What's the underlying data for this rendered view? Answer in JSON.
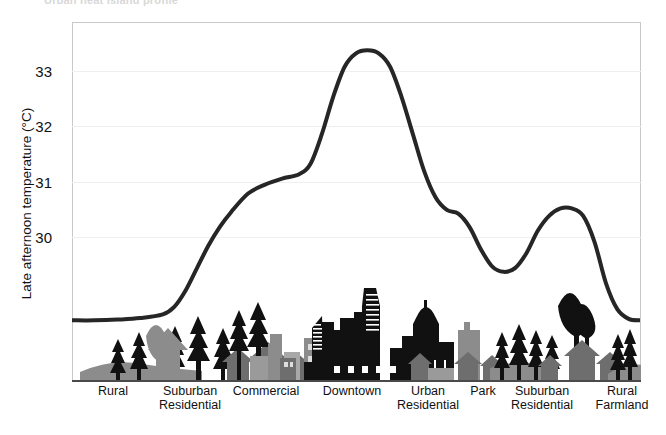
{
  "title": "Urban heat island profile",
  "axes": {
    "ylabel": "Late afternoon temperature (°C)",
    "yticks": [
      "33",
      "32",
      "31",
      "30"
    ],
    "ytick_values": [
      33,
      32,
      31,
      30
    ],
    "xlabels": [
      {
        "line1": "Rural",
        "line2": ""
      },
      {
        "line1": "Suburban",
        "line2": "Residential"
      },
      {
        "line1": "Commercial",
        "line2": ""
      },
      {
        "line1": "Downtown",
        "line2": ""
      },
      {
        "line1": "Urban",
        "line2": "Residential"
      },
      {
        "line1": "Park",
        "line2": ""
      },
      {
        "line1": "Suburban",
        "line2": "Residential"
      },
      {
        "line1": "Rural",
        "line2": "Farmland"
      }
    ]
  },
  "colors": {
    "line": "#262626",
    "grid": "#efefef",
    "frame": "#c9c9c9",
    "axis": "#4a4a4a",
    "silhouette_dark": "#111111",
    "silhouette_mid": "#8c8c8c",
    "silhouette_light": "#b5b5b5"
  },
  "chart_data": {
    "type": "line",
    "title": "Urban heat island profile",
    "xlabel": "",
    "ylabel": "Late afternoon temperature (°C)",
    "ylim": [
      28.8,
      33.6
    ],
    "xlim": [
      0,
      100
    ],
    "grid": true,
    "legend": "none",
    "categories": [
      "Rural",
      "Suburban Residential",
      "Commercial",
      "Downtown",
      "Urban Residential",
      "Park",
      "Suburban Residential",
      "Rural Farmland"
    ],
    "category_x": [
      7,
      21,
      34,
      49,
      63,
      72,
      83,
      97
    ],
    "category_values": [
      29.6,
      30.6,
      31.5,
      33.2,
      31.05,
      30.25,
      31.1,
      29.6
    ],
    "series": [
      {
        "name": "Late afternoon temperature",
        "x": [
          0,
          4,
          8,
          12,
          16,
          18,
          20,
          22,
          24,
          26,
          28,
          31,
          34,
          37,
          40,
          42,
          44,
          46,
          48,
          50,
          52,
          54,
          56,
          58,
          60,
          62,
          64,
          66,
          68,
          70,
          72,
          74,
          76,
          78,
          80,
          82,
          84,
          86,
          88,
          90,
          92,
          94,
          96,
          98,
          100
        ],
        "values": [
          29.6,
          29.6,
          29.61,
          29.63,
          29.68,
          29.78,
          30.0,
          30.3,
          30.6,
          30.85,
          31.05,
          31.3,
          31.42,
          31.5,
          31.56,
          31.7,
          32.1,
          32.6,
          33.0,
          33.18,
          33.22,
          33.18,
          33.0,
          32.6,
          32.1,
          31.6,
          31.25,
          31.08,
          31.03,
          30.85,
          30.55,
          30.32,
          30.25,
          30.3,
          30.5,
          30.8,
          31.0,
          31.1,
          31.1,
          31.0,
          30.65,
          30.1,
          29.75,
          29.62,
          29.6
        ]
      }
    ]
  },
  "silhouette": {
    "label": "urban-to-rural transect cityscape silhouette"
  }
}
